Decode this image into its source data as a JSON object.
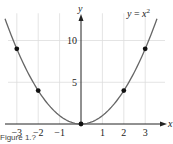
{
  "chart_data": {
    "type": "line",
    "title": "",
    "annotation": "y = x^2",
    "annotation_parts": {
      "lhs": "y",
      "eq": " = ",
      "base": "x",
      "exp": "2"
    },
    "xlabel": "x",
    "ylabel": "y",
    "xlim": [
      -3.8,
      3.8
    ],
    "ylim": [
      0,
      13.5
    ],
    "x_ticks": [
      -3,
      -2,
      -1,
      1,
      2,
      3
    ],
    "x_tick_labels": [
      "−3",
      "−2",
      "−1",
      "1",
      "2",
      "3"
    ],
    "y_ticks": [
      5,
      10
    ],
    "y_tick_labels": [
      "5",
      "10"
    ],
    "grid": true,
    "series": [
      {
        "name": "y = x^2",
        "function": "x^2",
        "color": "#666666"
      }
    ],
    "points": [
      {
        "x": -3,
        "y": 9
      },
      {
        "x": -2,
        "y": 4
      },
      {
        "x": 0,
        "y": 0
      },
      {
        "x": 2,
        "y": 4
      },
      {
        "x": 3,
        "y": 9
      }
    ]
  },
  "caption": "Figure 1.?",
  "colors": {
    "curve": "#666666",
    "grid": "#dddddd",
    "axis": "#222222",
    "point": "#111111"
  }
}
